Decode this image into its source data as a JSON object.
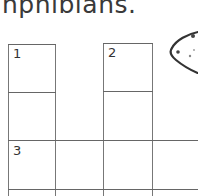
{
  "worksheet": {
    "heading_fragment": "nphibians.",
    "crossword": {
      "clue_numbers": [
        "1",
        "2",
        "3"
      ]
    },
    "illustration": "frog-icon"
  }
}
